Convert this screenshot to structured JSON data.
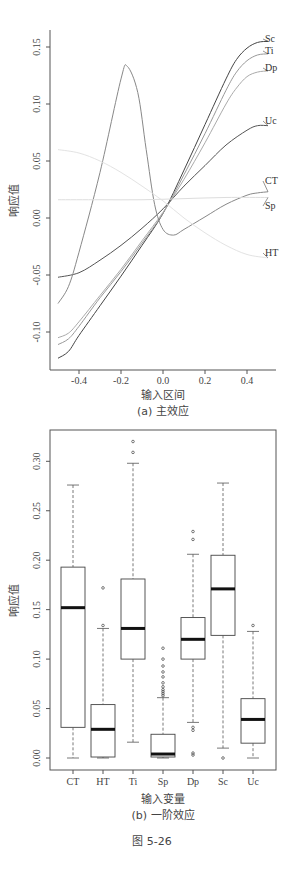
{
  "chart_data": [
    {
      "type": "line",
      "title": "",
      "caption": "(a) 主效应",
      "xlabel": "输入区间",
      "ylabel": "响应值",
      "xlim": [
        -0.52,
        0.52
      ],
      "ylim": [
        -0.13,
        0.165
      ],
      "x_ticks": [
        "-0.4",
        "-0.2",
        "0.0",
        "0.2",
        "0.4"
      ],
      "y_ticks": [
        "-0.10",
        "-0.05",
        "0.00",
        "0.05",
        "0.10",
        "0.15"
      ],
      "grid": false,
      "legend_position": "inline labels at right end",
      "series": [
        {
          "name": "Sc",
          "color": "#444444",
          "x": [
            -0.5,
            -0.45,
            -0.4,
            -0.3,
            -0.2,
            -0.1,
            0.0,
            0.1,
            0.2,
            0.3,
            0.35,
            0.4,
            0.45,
            0.5
          ],
          "y": [
            -0.123,
            -0.117,
            -0.103,
            -0.077,
            -0.051,
            -0.024,
            0.004,
            0.042,
            0.082,
            0.122,
            0.139,
            0.149,
            0.154,
            0.155
          ]
        },
        {
          "name": "Ti",
          "color": "#999999",
          "x": [
            -0.5,
            -0.45,
            -0.4,
            -0.3,
            -0.2,
            -0.1,
            0.0,
            0.1,
            0.2,
            0.3,
            0.35,
            0.4,
            0.45,
            0.5
          ],
          "y": [
            -0.111,
            -0.106,
            -0.095,
            -0.07,
            -0.047,
            -0.022,
            0.004,
            0.038,
            0.074,
            0.112,
            0.128,
            0.138,
            0.143,
            0.144
          ]
        },
        {
          "name": "Dp",
          "color": "#aaaaaa",
          "x": [
            -0.5,
            -0.45,
            -0.4,
            -0.3,
            -0.2,
            -0.1,
            0.0,
            0.1,
            0.2,
            0.3,
            0.35,
            0.4,
            0.45,
            0.5
          ],
          "y": [
            -0.105,
            -0.101,
            -0.091,
            -0.068,
            -0.045,
            -0.02,
            0.005,
            0.034,
            0.066,
            0.1,
            0.114,
            0.124,
            0.128,
            0.129
          ]
        },
        {
          "name": "Uc",
          "color": "#555555",
          "x": [
            -0.5,
            -0.4,
            -0.3,
            -0.2,
            -0.1,
            0.0,
            0.1,
            0.2,
            0.3,
            0.4,
            0.45,
            0.5
          ],
          "y": [
            -0.052,
            -0.048,
            -0.037,
            -0.024,
            -0.009,
            0.008,
            0.028,
            0.046,
            0.064,
            0.077,
            0.081,
            0.081
          ]
        },
        {
          "name": "CT",
          "color": "#888888",
          "x": [
            -0.5,
            -0.45,
            -0.4,
            -0.3,
            -0.2,
            -0.17,
            -0.12,
            -0.08,
            -0.04,
            0.0,
            0.05,
            0.1,
            0.2,
            0.3,
            0.4,
            0.45,
            0.5
          ],
          "y": [
            -0.075,
            -0.06,
            -0.03,
            0.04,
            0.122,
            0.133,
            0.11,
            0.06,
            0.012,
            -0.01,
            -0.015,
            -0.01,
            0.001,
            0.012,
            0.02,
            0.022,
            0.023
          ]
        },
        {
          "name": "Sp",
          "color": "#dddddd",
          "x": [
            -0.5,
            -0.3,
            -0.1,
            0.1,
            0.3,
            0.5
          ],
          "y": [
            0.016,
            0.016,
            0.016,
            0.017,
            0.018,
            0.018
          ]
        },
        {
          "name": "HT",
          "color": "#e3e3e3",
          "x": [
            -0.5,
            -0.4,
            -0.3,
            -0.2,
            -0.1,
            0.0,
            0.1,
            0.2,
            0.3,
            0.4,
            0.5
          ],
          "y": [
            0.06,
            0.057,
            0.05,
            0.04,
            0.028,
            0.015,
            0.0,
            -0.013,
            -0.024,
            -0.032,
            -0.035
          ]
        }
      ]
    },
    {
      "type": "box",
      "title": "",
      "caption": "(b) 一阶效应",
      "xlabel": "输入变量",
      "ylabel": "响应值",
      "ylim": [
        -0.01,
        0.33
      ],
      "y_ticks": [
        "0.00",
        "0.05",
        "0.10",
        "0.15",
        "0.20",
        "0.25",
        "0.30"
      ],
      "categories": [
        "CT",
        "HT",
        "Ti",
        "Sp",
        "Dp",
        "Sc",
        "Uc"
      ],
      "grid": false,
      "boxes": [
        {
          "name": "CT",
          "min": 0.0,
          "q1": 0.031,
          "median": 0.152,
          "q3": 0.193,
          "max": 0.276,
          "outliers": []
        },
        {
          "name": "HT",
          "min": 0.0,
          "q1": 0.001,
          "median": 0.029,
          "q3": 0.054,
          "max": 0.131,
          "outliers": [
            0.134,
            0.172
          ]
        },
        {
          "name": "Ti",
          "min": 0.016,
          "q1": 0.1,
          "median": 0.131,
          "q3": 0.181,
          "max": 0.298,
          "outliers": [
            0.309,
            0.32
          ]
        },
        {
          "name": "Sp",
          "min": 0.0,
          "q1": 0.001,
          "median": 0.004,
          "q3": 0.024,
          "max": 0.061,
          "outliers": [
            0.063,
            0.065,
            0.067,
            0.069,
            0.072,
            0.076,
            0.082,
            0.087,
            0.093,
            0.1,
            0.111
          ]
        },
        {
          "name": "Dp",
          "min": 0.036,
          "q1": 0.1,
          "median": 0.12,
          "q3": 0.142,
          "max": 0.206,
          "outliers": [
            0.221,
            0.229,
            0.028,
            0.031,
            0.003,
            0.005
          ]
        },
        {
          "name": "Sc",
          "min": 0.01,
          "q1": 0.124,
          "median": 0.171,
          "q3": 0.205,
          "max": 0.278,
          "outliers": [
            0.0
          ]
        },
        {
          "name": "Uc",
          "min": 0.0,
          "q1": 0.015,
          "median": 0.039,
          "q3": 0.06,
          "max": 0.128,
          "outliers": [
            0.134
          ]
        }
      ]
    }
  ],
  "figure": {
    "label": "图 5-26"
  },
  "top_chart": {
    "ylabel": "响应值",
    "xlabel": "输入区间",
    "caption": "(a) 主效应",
    "y_ticks": [
      {
        "label": "0.15",
        "value": 0.15
      },
      {
        "label": "0.10",
        "value": 0.1
      },
      {
        "label": "0.05",
        "value": 0.05
      },
      {
        "label": "0.00",
        "value": 0.0
      },
      {
        "label": "-0.05",
        "value": -0.05
      },
      {
        "label": "-0.10",
        "value": -0.1
      }
    ],
    "x_ticks": [
      {
        "label": "-0.4",
        "value": -0.4
      },
      {
        "label": "-0.2",
        "value": -0.2
      },
      {
        "label": "0.0",
        "value": 0.0
      },
      {
        "label": "0.2",
        "value": 0.2
      },
      {
        "label": "0.4",
        "value": 0.4
      }
    ]
  },
  "bottom_chart": {
    "ylabel": "响应值",
    "xlabel": "输入变量",
    "caption": "(b) 一阶效应",
    "y_ticks": [
      {
        "label": "0.30",
        "value": 0.3
      },
      {
        "label": "0.25",
        "value": 0.25
      },
      {
        "label": "0.20",
        "value": 0.2
      },
      {
        "label": "0.15",
        "value": 0.15
      },
      {
        "label": "0.10",
        "value": 0.1
      },
      {
        "label": "0.05",
        "value": 0.05
      },
      {
        "label": "0.00",
        "value": 0.0
      }
    ]
  }
}
